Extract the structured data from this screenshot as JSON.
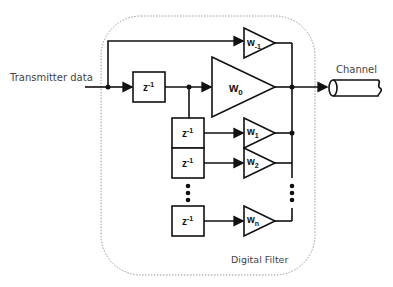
{
  "diagram": {
    "title": "Digital Filter",
    "input_label": "Transmitter data",
    "output_label": "Channel",
    "container_label": "Digital Filter",
    "delay_blocks": [
      {
        "label": "z",
        "exp": "-1"
      },
      {
        "label": "z",
        "exp": "-1"
      },
      {
        "label": "z",
        "exp": "-1"
      },
      {
        "label": "z",
        "exp": "-1"
      }
    ],
    "taps": [
      {
        "label": "w",
        "sub": "-1"
      },
      {
        "label": "w",
        "sub": "0"
      },
      {
        "label": "w",
        "sub": "1"
      },
      {
        "label": "w",
        "sub": "2"
      },
      {
        "label": "w",
        "sub": "n"
      }
    ],
    "colors": {
      "stroke": "#111111",
      "container_border": "#9a9a9a",
      "text": "#444444"
    }
  }
}
